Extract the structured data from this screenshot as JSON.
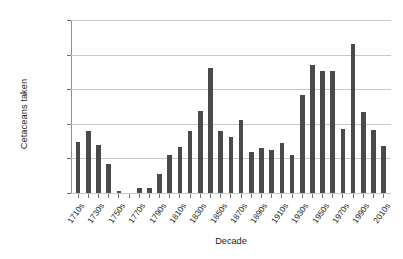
{
  "chart_data": {
    "type": "bar",
    "title": "",
    "xlabel": "Decade",
    "ylabel": "Cetaceans taken",
    "ylim": [
      0,
      25000
    ],
    "ytick_labels": [
      "0",
      "5,000",
      "10,000",
      "15,000",
      "20,000",
      "25,000"
    ],
    "ytick_values": [
      0,
      5000,
      10000,
      15000,
      20000,
      25000
    ],
    "grid": true,
    "legend": "none",
    "bar_color": "#4a4a4a",
    "gridline_color": "#c9c9c9",
    "axis_color": "#6e6e6e",
    "categories": [
      "1710s",
      "1720s",
      "1730s",
      "1740s",
      "1750s",
      "1760s",
      "1770s",
      "1780s",
      "1790s",
      "1800s",
      "1810s",
      "1820s",
      "1830s",
      "1840s",
      "1850s",
      "1860s",
      "1870s",
      "1880s",
      "1890s",
      "1900s",
      "1910s",
      "1920s",
      "1930s",
      "1940s",
      "1950s",
      "1960s",
      "1970s",
      "1980s",
      "1990s",
      "2000s",
      "2010s"
    ],
    "labeled_categories": [
      "1710s",
      "1730s",
      "1750s",
      "1770s",
      "1790s",
      "1810s",
      "1830s",
      "1850s",
      "1870s",
      "1890s",
      "1910s",
      "1930s",
      "1950s",
      "1970s",
      "1990s",
      "2010s"
    ],
    "values": [
      7400,
      8900,
      7000,
      4200,
      300,
      0,
      700,
      700,
      2800,
      5500,
      6700,
      8900,
      11900,
      18000,
      8900,
      8100,
      10600,
      5900,
      6500,
      6200,
      7200,
      5500,
      14200,
      18500,
      17600,
      17700,
      9300,
      21600,
      11700,
      9100,
      6800
    ]
  }
}
